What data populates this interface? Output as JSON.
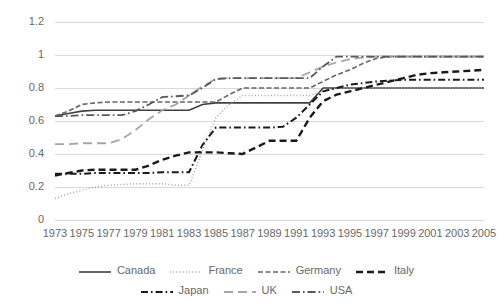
{
  "chart_data": {
    "type": "line",
    "title": "",
    "subtitle": "",
    "xlabel": "",
    "ylabel": "",
    "xlim": [
      1973,
      2005
    ],
    "ylim": [
      0,
      1.2
    ],
    "grid": true,
    "legend_position": "bottom",
    "x_tick_labels": [
      "1973",
      "1975",
      "1977",
      "1979",
      "1981",
      "1983",
      "1985",
      "1987",
      "1989",
      "1991",
      "1993",
      "1995",
      "1997",
      "1999",
      "2001",
      "2003",
      "2005"
    ],
    "y_tick_labels": [
      "0",
      "0.2",
      "0.4",
      "0.6",
      "0.8",
      "1",
      "1.2"
    ],
    "y_ticks": [
      0,
      0.2,
      0.4,
      0.6,
      0.8,
      1,
      1.2
    ],
    "x": [
      1973,
      1974,
      1975,
      1976,
      1977,
      1978,
      1979,
      1980,
      1981,
      1982,
      1983,
      1984,
      1985,
      1986,
      1987,
      1988,
      1989,
      1990,
      1991,
      1992,
      1993,
      1994,
      1995,
      1996,
      1997,
      1998,
      1999,
      2000,
      2001,
      2002,
      2003,
      2004,
      2005
    ],
    "series": [
      {
        "name": "Canada",
        "color": "#404040",
        "dash": "solid",
        "width": 1.6,
        "values": [
          0.63,
          0.645,
          0.66,
          0.665,
          0.665,
          0.665,
          0.665,
          0.665,
          0.665,
          0.665,
          0.665,
          0.7,
          0.71,
          0.71,
          0.71,
          0.71,
          0.71,
          0.71,
          0.71,
          0.71,
          0.8,
          0.8,
          0.8,
          0.8,
          0.8,
          0.8,
          0.8,
          0.8,
          0.8,
          0.8,
          0.8,
          0.8,
          0.8
        ]
      },
      {
        "name": "France",
        "color": "#a6a6a6",
        "dash": "dotted",
        "width": 1.5,
        "values": [
          0.13,
          0.16,
          0.18,
          0.2,
          0.21,
          0.215,
          0.22,
          0.22,
          0.22,
          0.21,
          0.21,
          0.42,
          0.62,
          0.7,
          0.755,
          0.755,
          0.755,
          0.755,
          0.755,
          0.755,
          0.78,
          0.8,
          0.8,
          0.8,
          0.8,
          0.8,
          0.8,
          0.8,
          0.8,
          0.8,
          0.8,
          0.8,
          0.8
        ]
      },
      {
        "name": "Germany",
        "color": "#666666",
        "dash": "dashed",
        "width": 1.6,
        "values": [
          0.63,
          0.66,
          0.7,
          0.71,
          0.715,
          0.715,
          0.715,
          0.715,
          0.715,
          0.715,
          0.715,
          0.715,
          0.715,
          0.76,
          0.8,
          0.8,
          0.8,
          0.8,
          0.8,
          0.8,
          0.84,
          0.88,
          0.91,
          0.95,
          0.98,
          0.99,
          0.99,
          0.99,
          0.99,
          0.99,
          0.99,
          0.99,
          0.99
        ]
      },
      {
        "name": "Italy",
        "color": "#1a1a1a",
        "dash": "bold-dash",
        "width": 2.4,
        "values": [
          0.27,
          0.285,
          0.3,
          0.305,
          0.305,
          0.305,
          0.305,
          0.33,
          0.365,
          0.39,
          0.41,
          0.41,
          0.41,
          0.405,
          0.4,
          0.44,
          0.48,
          0.48,
          0.48,
          0.62,
          0.72,
          0.76,
          0.78,
          0.8,
          0.82,
          0.84,
          0.86,
          0.88,
          0.89,
          0.895,
          0.9,
          0.905,
          0.91
        ]
      },
      {
        "name": "Japan",
        "color": "#1a1a1a",
        "dash": "dashdot",
        "width": 2.0,
        "values": [
          0.28,
          0.28,
          0.28,
          0.285,
          0.285,
          0.285,
          0.285,
          0.285,
          0.29,
          0.29,
          0.29,
          0.455,
          0.56,
          0.56,
          0.56,
          0.56,
          0.56,
          0.565,
          0.62,
          0.7,
          0.78,
          0.8,
          0.82,
          0.83,
          0.84,
          0.845,
          0.85,
          0.85,
          0.85,
          0.85,
          0.85,
          0.85,
          0.85
        ]
      },
      {
        "name": "UK",
        "color": "#a6a6a6",
        "dash": "longdash",
        "width": 1.8,
        "values": [
          0.46,
          0.46,
          0.465,
          0.465,
          0.465,
          0.49,
          0.545,
          0.61,
          0.665,
          0.7,
          0.755,
          0.81,
          0.855,
          0.86,
          0.86,
          0.86,
          0.86,
          0.86,
          0.86,
          0.895,
          0.93,
          0.955,
          0.975,
          0.985,
          0.99,
          0.99,
          0.99,
          0.99,
          0.99,
          0.99,
          0.99,
          0.99,
          0.99
        ]
      },
      {
        "name": "USA",
        "color": "#595959",
        "dash": "dashdotdot",
        "width": 1.8,
        "values": [
          0.63,
          0.63,
          0.635,
          0.635,
          0.635,
          0.635,
          0.66,
          0.7,
          0.745,
          0.75,
          0.755,
          0.8,
          0.855,
          0.86,
          0.86,
          0.86,
          0.86,
          0.86,
          0.86,
          0.86,
          0.93,
          0.99,
          0.99,
          0.99,
          0.99,
          0.99,
          0.99,
          0.99,
          0.99,
          0.99,
          0.99,
          0.99,
          0.99
        ]
      }
    ]
  },
  "legend": {
    "items": [
      {
        "label": "Canada",
        "style": "solid-dark"
      },
      {
        "label": "France",
        "style": "dotted-light"
      },
      {
        "label": "Germany",
        "style": "dashed-gray"
      },
      {
        "label": "Italy",
        "style": "bold-dash-black"
      },
      {
        "label": "Japan",
        "style": "dashdot-black"
      },
      {
        "label": "UK",
        "style": "longdash-gray"
      },
      {
        "label": "USA",
        "style": "dashdotdot-gray"
      }
    ]
  },
  "colors": {
    "gridline": "#d9d9d9",
    "axis_text": "#686868",
    "background": "#ffffff"
  }
}
